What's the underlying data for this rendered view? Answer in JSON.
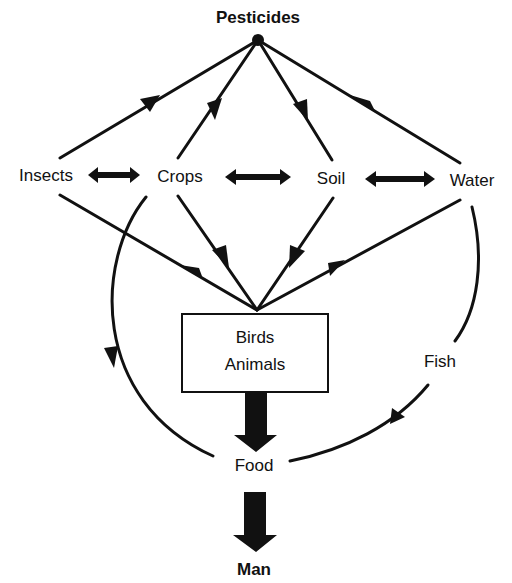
{
  "diagram": {
    "title": "Pesticides",
    "nodes": {
      "pesticides": "Pesticides",
      "insects": "Insects",
      "crops": "Crops",
      "soil": "Soil",
      "water": "Water",
      "birds": "Birds",
      "animals": "Animals",
      "fish": "Fish",
      "food": "Food",
      "man": "Man"
    },
    "edges": [
      {
        "from": "Pesticides",
        "to": "Insects"
      },
      {
        "from": "Pesticides",
        "to": "Crops"
      },
      {
        "from": "Pesticides",
        "to": "Soil"
      },
      {
        "from": "Pesticides",
        "to": "Water"
      },
      {
        "from": "Insects",
        "to": "Crops",
        "bidirectional": true
      },
      {
        "from": "Crops",
        "to": "Soil",
        "bidirectional": true
      },
      {
        "from": "Soil",
        "to": "Water",
        "bidirectional": true
      },
      {
        "from": "Insects",
        "to": "Birds/Animals"
      },
      {
        "from": "Crops",
        "to": "Birds/Animals"
      },
      {
        "from": "Soil",
        "to": "Birds/Animals"
      },
      {
        "from": "Water",
        "to": "Birds/Animals"
      },
      {
        "from": "Crops",
        "to": "Food"
      },
      {
        "from": "Water",
        "to": "Fish"
      },
      {
        "from": "Fish",
        "to": "Food"
      },
      {
        "from": "Birds/Animals",
        "to": "Food"
      },
      {
        "from": "Food",
        "to": "Man"
      }
    ]
  }
}
